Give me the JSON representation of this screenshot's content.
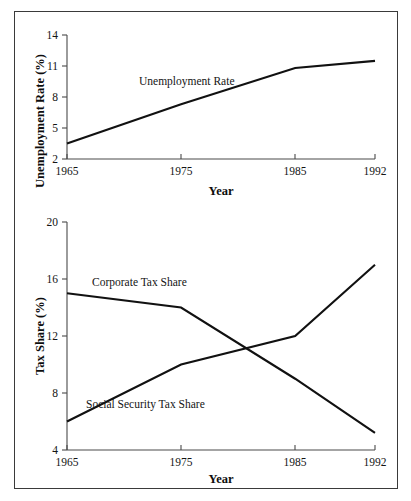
{
  "figure": {
    "background_color": "#ffffff",
    "frame_color": "#3a3a3a",
    "line_color": "#111111",
    "axis_color": "#4a4a4a"
  },
  "charts": {
    "top": {
      "ylabel": "Unemployment Rate (%)",
      "xlabel": "Year",
      "y_ticks": [
        "2",
        "5",
        "8",
        "11",
        "14"
      ],
      "x_ticks": [
        "1965",
        "1975",
        "1985",
        "1992"
      ],
      "annotation": "Unemployment Rate"
    },
    "bottom": {
      "ylabel": "Tax Share (%)",
      "xlabel": "Year",
      "y_ticks": [
        "4",
        "8",
        "12",
        "16",
        "20"
      ],
      "x_ticks": [
        "1965",
        "1975",
        "1985",
        "1992"
      ],
      "annotation_corporate": "Corporate Tax Share",
      "annotation_social_security": "Social Security Tax Share"
    }
  },
  "chart_data": [
    {
      "type": "line",
      "title": "",
      "xlabel": "Year",
      "ylabel": "Unemployment Rate (%)",
      "x": [
        1965,
        1975,
        1985,
        1992
      ],
      "xlim": [
        1965,
        1992
      ],
      "ylim": [
        2,
        14
      ],
      "yticks": [
        2,
        5,
        8,
        11,
        14
      ],
      "xticks": [
        1965,
        1975,
        1985,
        1992
      ],
      "grid": false,
      "legend": "inline-annotation",
      "series": [
        {
          "name": "Unemployment Rate",
          "values": [
            3.5,
            7.3,
            10.8,
            11.5
          ]
        }
      ]
    },
    {
      "type": "line",
      "title": "",
      "xlabel": "Year",
      "ylabel": "Tax Share (%)",
      "x": [
        1965,
        1975,
        1985,
        1992
      ],
      "xlim": [
        1965,
        1992
      ],
      "ylim": [
        4,
        20
      ],
      "yticks": [
        4,
        8,
        12,
        16,
        20
      ],
      "xticks": [
        1965,
        1975,
        1985,
        1992
      ],
      "grid": false,
      "legend": "inline-annotation",
      "series": [
        {
          "name": "Corporate Tax Share",
          "values": [
            15.0,
            14.0,
            9.0,
            5.2
          ]
        },
        {
          "name": "Social Security Tax Share",
          "values": [
            6.0,
            10.0,
            12.0,
            17.0
          ]
        }
      ]
    }
  ]
}
